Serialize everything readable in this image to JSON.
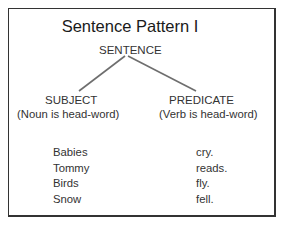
{
  "diagram": {
    "title": "Sentence Pattern I",
    "root": "SENTENCE",
    "branches": {
      "subject": {
        "label": "SUBJECT",
        "note": "(Noun is head-word)"
      },
      "predicate": {
        "label": "PREDICATE",
        "note": "(Verb is head-word)"
      }
    },
    "examples": {
      "subjects": [
        "Babies",
        "Tommy",
        "Birds",
        "Snow"
      ],
      "predicates": [
        "cry.",
        "reads.",
        "fly.",
        "fell."
      ]
    },
    "colors": {
      "line": "#6e6e6e",
      "border": "#333333",
      "text": "#333333"
    }
  }
}
